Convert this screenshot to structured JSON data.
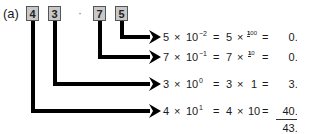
{
  "figure": {
    "label": "(a)",
    "digits": [
      {
        "value": "4",
        "place_exponent": 1
      },
      {
        "value": "3",
        "place_exponent": 0
      },
      {
        "value": "7",
        "place_exponent": -1
      },
      {
        "value": "5",
        "place_exponent": -2
      }
    ],
    "decimal_separator": "·",
    "rows": [
      {
        "digit": "5",
        "times": "×",
        "base": "10",
        "exp": "−2",
        "eq1": "=",
        "digit2": "5",
        "times2": "×",
        "frac_num": "1",
        "frac_den": "100",
        "eq2": "=",
        "value": "0.05"
      },
      {
        "digit": "7",
        "times": "×",
        "base": "10",
        "exp": "−1",
        "eq1": "=",
        "digit2": "7",
        "times2": "×",
        "frac_num": "1",
        "frac_den": "10",
        "eq2": "=",
        "value": "0.70"
      },
      {
        "digit": "3",
        "times": "×",
        "base": "10",
        "exp": "0",
        "eq1": "=",
        "digit2": "3",
        "times2": "×",
        "factor": "1",
        "eq2": "=",
        "value": "3.00"
      },
      {
        "digit": "4",
        "times": "×",
        "base": "10",
        "exp": "1",
        "eq1": "=",
        "digit2": "4",
        "times2": "×",
        "factor": "10",
        "eq2": "=",
        "value": "40.00"
      }
    ],
    "total": "43.75",
    "colors": {
      "box_fill": "#c8c8c8",
      "box_border": "#555555",
      "wire": "#000000",
      "text": "#1a1a1a"
    }
  }
}
